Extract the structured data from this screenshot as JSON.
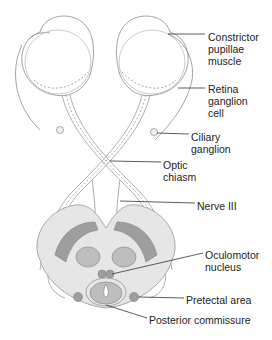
{
  "figure": {
    "labels": [
      {
        "id": "constrictor",
        "text": "Constrictor\npupillae\nmuscle"
      },
      {
        "id": "retina",
        "text": "Retina\nganglion\ncell"
      },
      {
        "id": "ciliary",
        "text": "Ciliary\nganglion"
      },
      {
        "id": "optic",
        "text": "Optic\nchiasm"
      },
      {
        "id": "nerve3",
        "text": "Nerve III"
      },
      {
        "id": "oculomotor",
        "text": "Oculomotor\nnucleus"
      },
      {
        "id": "pretectal",
        "text": "Pretectal area"
      },
      {
        "id": "posterior",
        "text": "Posterior commissure"
      }
    ],
    "colors": {
      "outline": "#8a8a8a",
      "fill_light": "#e6e6e6",
      "fill_mid": "#bdbdbd",
      "fill_dark": "#9e9e9e",
      "leader": "#333333",
      "text": "#222222"
    }
  }
}
